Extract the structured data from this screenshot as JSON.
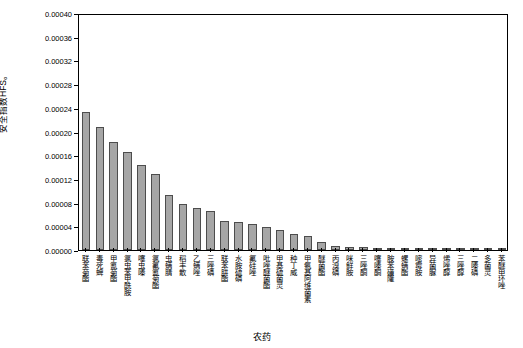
{
  "chart_data": {
    "type": "bar",
    "title": "",
    "xlabel": "农药",
    "ylabel": "安全指数HFS。",
    "ylim": [
      0,
      0.0004
    ],
    "ytick_labels": [
      "0.00000",
      "0.00004",
      "0.00008",
      "0.00012",
      "0.00016",
      "0.00020",
      "0.00024",
      "0.00028",
      "0.00032",
      "0.00036",
      "0.00040"
    ],
    "ytick_values": [
      0,
      4e-05,
      8e-05,
      0.00012,
      0.00016,
      0.0002,
      0.00024,
      0.00028,
      0.00032,
      0.00036,
      0.0004
    ],
    "grid": false,
    "legend": "none",
    "categories": [
      "联苯菊酯",
      "毒死蜱",
      "甲氰菊酯",
      "氯虫苯甲酰胺",
      "噻虫嗪",
      "氯氟氰菊酯",
      "虫螨腈",
      "稻丰散",
      "乙螨唑",
      "三唑磷",
      "联苯肼酯",
      "水胺硫磷",
      "氟硅唑",
      "吡唑醚菌酯",
      "甲基硫菌灵",
      "种丁威",
      "甲氨基阿维菌素",
      "醚菌酯",
      "丙溴磷",
      "咪鲜胺",
      "三唑酮",
      "噻嗪酮",
      "胺苯磺隆",
      "螺螨酯",
      "嘧霉胺",
      "异菌脲",
      "烯唑醇",
      "三唑醇",
      "二嗪磷",
      "多菌灵",
      "苯醚甲环唑"
    ],
    "values": [
      0.000233,
      0.000208,
      0.000183,
      0.000165,
      0.000143,
      0.000128,
      9.3e-05,
      7.75e-05,
      7.05e-05,
      6.55e-05,
      4.98e-05,
      4.65e-05,
      4.43e-05,
      3.9e-05,
      3.38e-05,
      2.78e-05,
      2.38e-05,
      1.42e-05,
      6e-06,
      5.4e-06,
      4.6e-06,
      4e-06,
      3.4e-06,
      2.9e-06,
      2.5e-06,
      2e-06,
      1.6e-06,
      1.3e-06,
      1e-06,
      7e-07,
      4e-07
    ],
    "bar_fill_color": "#a6a6a6",
    "bar_edge_color": "#4d4d4d"
  }
}
